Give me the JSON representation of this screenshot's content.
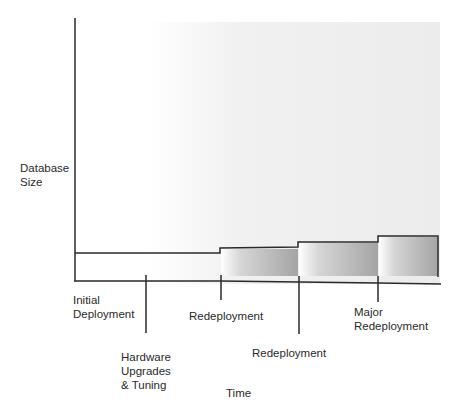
{
  "diagram": {
    "y_axis_label": [
      "Database",
      "Size"
    ],
    "x_axis_label": "Time",
    "events": [
      {
        "label_lines": [
          "Initial",
          "Deployment"
        ]
      },
      {
        "label_lines": [
          "Hardware",
          "Upgrades",
          "& Tuning"
        ]
      },
      {
        "label_lines": [
          "Redeployment"
        ]
      },
      {
        "label_lines": [
          "Redeployment"
        ]
      },
      {
        "label_lines": [
          "Major",
          "Redeployment"
        ]
      }
    ],
    "colors": {
      "line": "#2a2a2a",
      "fill_dark": "#a9a9a9",
      "fill_light": "#ffffff",
      "background": "#ececec"
    }
  }
}
